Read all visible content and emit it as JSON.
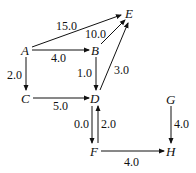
{
  "graph": {
    "type": "directed-weighted-graph",
    "nodes": [
      {
        "id": "A",
        "label": "A",
        "x": 25,
        "y": 54
      },
      {
        "id": "B",
        "label": "B",
        "x": 95,
        "y": 54
      },
      {
        "id": "C",
        "label": "C",
        "x": 25,
        "y": 102
      },
      {
        "id": "D",
        "label": "D",
        "x": 95,
        "y": 102
      },
      {
        "id": "E",
        "label": "E",
        "x": 129,
        "y": 18
      },
      {
        "id": "F",
        "label": "F",
        "x": 94,
        "y": 155
      },
      {
        "id": "G",
        "label": "G",
        "x": 171,
        "y": 103
      },
      {
        "id": "H",
        "label": "H",
        "x": 171,
        "y": 155
      }
    ],
    "edges": [
      {
        "from": "A",
        "to": "E",
        "weight": "15.0"
      },
      {
        "from": "B",
        "to": "E",
        "weight": "10.0"
      },
      {
        "from": "A",
        "to": "B",
        "weight": "4.0"
      },
      {
        "from": "A",
        "to": "C",
        "weight": "2.0"
      },
      {
        "from": "B",
        "to": "D",
        "weight": "1.0"
      },
      {
        "from": "D",
        "to": "E",
        "weight": "3.0"
      },
      {
        "from": "C",
        "to": "D",
        "weight": "5.0"
      },
      {
        "from": "D",
        "to": "F",
        "weight": "0.0"
      },
      {
        "from": "F",
        "to": "D",
        "weight": "2.0"
      },
      {
        "from": "G",
        "to": "H",
        "weight": "4.0"
      },
      {
        "from": "F",
        "to": "H",
        "weight": "4.0"
      }
    ]
  }
}
